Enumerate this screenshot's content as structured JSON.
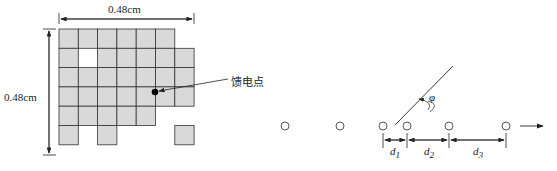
{
  "left_figure": {
    "width_label": "0.48cm",
    "height_label": "0.48cm",
    "feed_label": "馈电点",
    "grid": {
      "origin_x": 59,
      "origin_y": 29,
      "cell": 19.3,
      "rows": [
        [
          0,
          1,
          2,
          3,
          4,
          5
        ],
        [
          0,
          2,
          3,
          4,
          5,
          6
        ],
        [
          0,
          1,
          2,
          3,
          4,
          5,
          6
        ],
        [
          0,
          1,
          2,
          3,
          4,
          5,
          6
        ],
        [
          0,
          1,
          2,
          3,
          4
        ],
        [
          0,
          2,
          6
        ]
      ]
    },
    "colors": {
      "cell_fill": "#d9d9d9",
      "cell_stroke": "#333333"
    }
  },
  "right_figure": {
    "angle_label": "φ",
    "spacing_labels": [
      "d1",
      "d2",
      "d3"
    ],
    "element_x": [
      285,
      340,
      383,
      407,
      449,
      506
    ],
    "element_y": 126
  }
}
